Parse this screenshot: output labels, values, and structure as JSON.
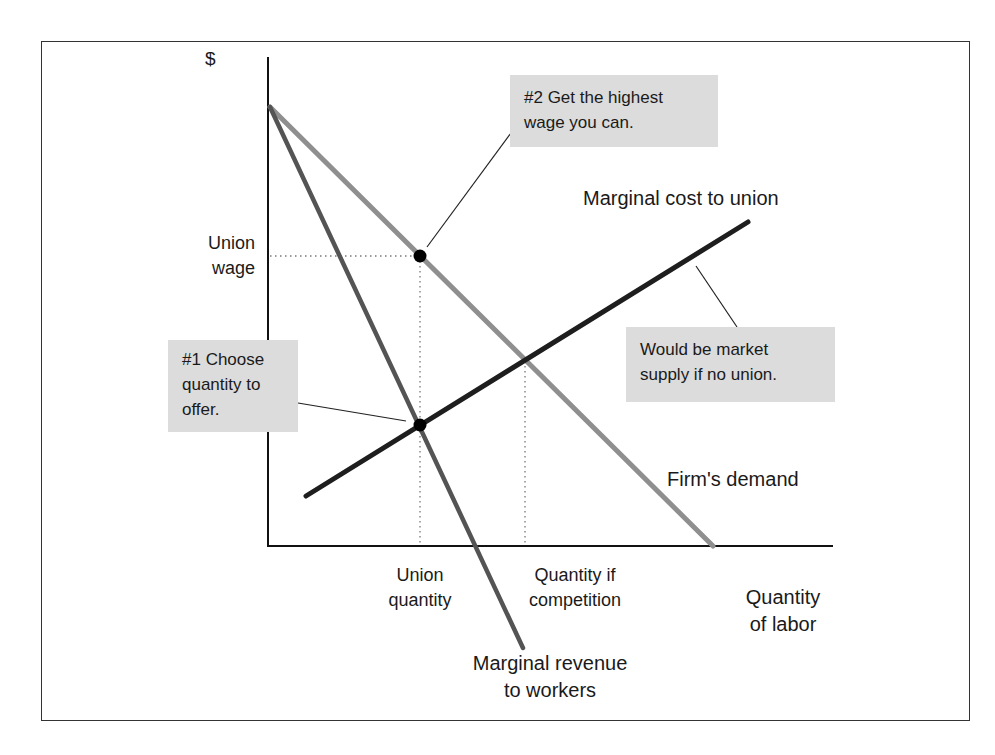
{
  "chart_data": {
    "type": "line",
    "xlabel": "Quantity of labor",
    "ylabel": "$",
    "grid": false,
    "axes": {
      "origin_px": [
        268,
        546
      ],
      "x_end_px": 833,
      "y_top_px": 57
    },
    "series": [
      {
        "name": "Firm's demand",
        "color": "#8f8f8f",
        "width": 5,
        "points_px": [
          [
            270,
            107
          ],
          [
            713,
            546
          ]
        ]
      },
      {
        "name": "Marginal revenue to workers",
        "color": "#545454",
        "width": 4.5,
        "points_px": [
          [
            270,
            107
          ],
          [
            523,
            648
          ]
        ]
      },
      {
        "name": "Marginal cost to union",
        "color": "#1e1e1e",
        "width": 5,
        "points_px": [
          [
            306,
            496
          ],
          [
            748,
            222
          ]
        ]
      }
    ],
    "points": [
      {
        "name": "Union wage point (on demand curve)",
        "px": [
          420,
          256
        ]
      },
      {
        "name": "Union quantity point (MR = MC)",
        "px": [
          420,
          425
        ]
      }
    ],
    "reference_lines": [
      {
        "name": "union-wage-guide",
        "from_px": [
          270,
          256
        ],
        "to_px": [
          420,
          256
        ],
        "style": "dotted"
      },
      {
        "name": "union-quantity-guide",
        "from_px": [
          420,
          256
        ],
        "to_px": [
          420,
          546
        ],
        "style": "dotted"
      },
      {
        "name": "competition-quantity-guide",
        "from_px": [
          525,
          361
        ],
        "to_px": [
          525,
          546
        ],
        "style": "dotted"
      }
    ],
    "leaders": [
      {
        "name": "note2-leader",
        "from_px": [
          427,
          247
        ],
        "to_px": [
          511,
          133
        ]
      },
      {
        "name": "note1-leader",
        "from_px": [
          298,
          403
        ],
        "to_px": [
          406,
          421
        ]
      },
      {
        "name": "note3-leader",
        "from_px": [
          737,
          327
        ],
        "to_px": [
          696,
          266
        ]
      }
    ],
    "tick_labels": {
      "y": [
        "Union wage"
      ],
      "x": [
        "Union quantity",
        "Quantity if competition"
      ]
    },
    "annotations": [
      "#2 Get the highest wage you can.",
      "#1 Choose quantity to offer.",
      "Would be market supply if no union."
    ]
  },
  "labels": {
    "y_axis": "$",
    "union_wage": [
      "Union",
      "wage"
    ],
    "union_quantity": [
      "Union",
      "quantity"
    ],
    "competition_quantity": [
      "Quantity if",
      "competition"
    ],
    "x_axis": [
      "Quantity",
      "of labor"
    ],
    "mc_curve": "Marginal cost to union",
    "demand_curve": "Firm's demand",
    "mr_curve": [
      "Marginal revenue",
      "to workers"
    ]
  },
  "notes": {
    "step2": [
      "#2 Get the highest",
      "wage you can."
    ],
    "step1": [
      "#1 Choose",
      "quantity to",
      "offer."
    ],
    "supply": [
      "Would be market",
      "supply if no union."
    ]
  }
}
